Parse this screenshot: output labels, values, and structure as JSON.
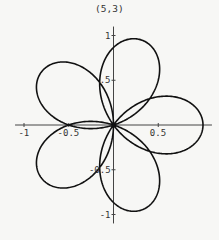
{
  "chart_data": {
    "type": "line",
    "subtype": "polar-rose",
    "title": "(5,3)",
    "equation": "r = cos(5θ/3)",
    "p": 5,
    "q": 3,
    "theta_range": [
      0,
      18.8496
    ],
    "petals": 5,
    "petal_angles_deg": [
      0,
      72,
      144,
      216,
      288
    ],
    "petal_length": 1,
    "xlim": [
      -1.1,
      1.1
    ],
    "ylim": [
      -1.1,
      1.1
    ],
    "x_ticks": [
      {
        "value": -1,
        "label": "-1"
      },
      {
        "value": -0.5,
        "label": "-0.5"
      },
      {
        "value": 0.5,
        "label": "0.5"
      }
    ],
    "y_ticks": [
      {
        "value": 1,
        "label": "1"
      },
      {
        "value": 0.5,
        "label": ".5"
      },
      {
        "value": -0.5,
        "label": "-0.5"
      },
      {
        "value": -1,
        "label": "-1"
      }
    ],
    "grid": false,
    "legend": null,
    "line_color": "#111111",
    "axis_color": "#333333"
  },
  "layout": {
    "origin_px": [
      113.5,
      125
    ],
    "scale_px_per_unit": 89.5
  }
}
